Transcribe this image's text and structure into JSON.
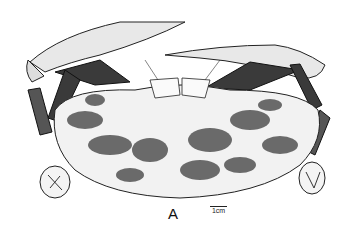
{
  "figure": {
    "panel_label": "A",
    "scale_bar": {
      "label": "1cm"
    },
    "colors": {
      "ink": "#222222",
      "mottle": "#6a6a6a",
      "background": "#ffffff",
      "shell": "#f2f2f2"
    }
  }
}
